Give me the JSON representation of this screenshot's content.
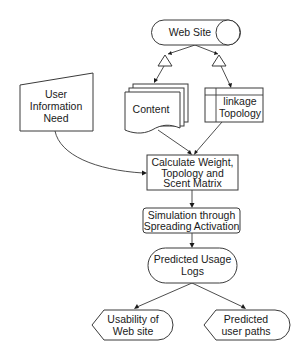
{
  "diagram": {
    "type": "flowchart",
    "colors": {
      "stroke": "#3a3a3a",
      "text": "#1a1a1a",
      "background": "#ffffff"
    },
    "nodes": {
      "website": {
        "shape": "stored-data-cylinder",
        "lines": [
          "Web Site"
        ]
      },
      "user_need": {
        "shape": "manual-input",
        "lines": [
          "User",
          "Information",
          "Need"
        ]
      },
      "content": {
        "shape": "multi-document",
        "lines": [
          "Content"
        ]
      },
      "linkage": {
        "shape": "internal-storage",
        "lines": [
          "linkage",
          "Topology"
        ]
      },
      "calculate": {
        "shape": "process",
        "lines": [
          "Calculate Weight,",
          "Topology and",
          "Scent Matrix"
        ]
      },
      "simulation": {
        "shape": "rounded-process",
        "lines": [
          "Simulation through",
          "Spreading Activation"
        ]
      },
      "usage_logs": {
        "shape": "terminator",
        "lines": [
          "Predicted Usage",
          "Logs"
        ]
      },
      "usability": {
        "shape": "display",
        "lines": [
          "Usability of",
          "Web site"
        ]
      },
      "user_paths": {
        "shape": "display",
        "lines": [
          "Predicted",
          "user paths"
        ]
      }
    },
    "edges": [
      {
        "from": "website",
        "to": "content",
        "marker": "triangle-merge"
      },
      {
        "from": "website",
        "to": "linkage",
        "marker": "triangle-merge"
      },
      {
        "from": "content",
        "to": "calculate"
      },
      {
        "from": "linkage",
        "to": "calculate"
      },
      {
        "from": "user_need",
        "to": "calculate"
      },
      {
        "from": "calculate",
        "to": "simulation"
      },
      {
        "from": "simulation",
        "to": "usage_logs"
      },
      {
        "from": "usage_logs",
        "to": "usability"
      },
      {
        "from": "usage_logs",
        "to": "user_paths"
      }
    ]
  }
}
